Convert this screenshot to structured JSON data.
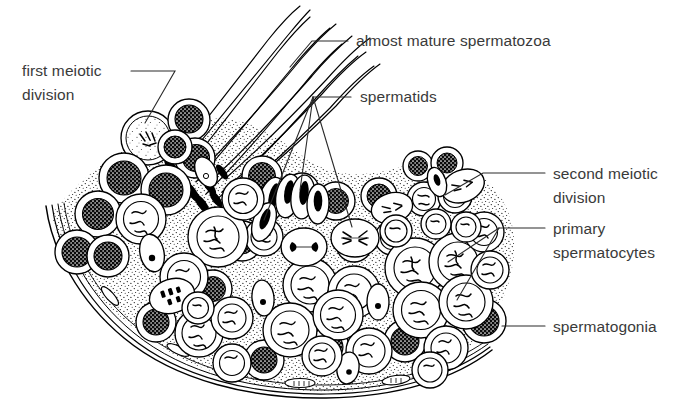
{
  "figure": {
    "background_color": "#ffffff",
    "ink_color": "#000000",
    "label_color": "#3a3a3a"
  },
  "labels": [
    {
      "id": "first-meiotic-division",
      "line1": "first meiotic",
      "line2": "division"
    },
    {
      "id": "almost-mature-spermatozoa",
      "line1": "almost mature spermatozoa",
      "line2": ""
    },
    {
      "id": "spermatids",
      "line1": "spermatids",
      "line2": ""
    },
    {
      "id": "second-meiotic-division",
      "line1": "second meiotic",
      "line2": "division"
    },
    {
      "id": "primary-spermatocytes",
      "line1": "primary",
      "line2": "spermatocytes"
    },
    {
      "id": "spermatogonia",
      "line1": "spermatogonia",
      "line2": ""
    }
  ]
}
